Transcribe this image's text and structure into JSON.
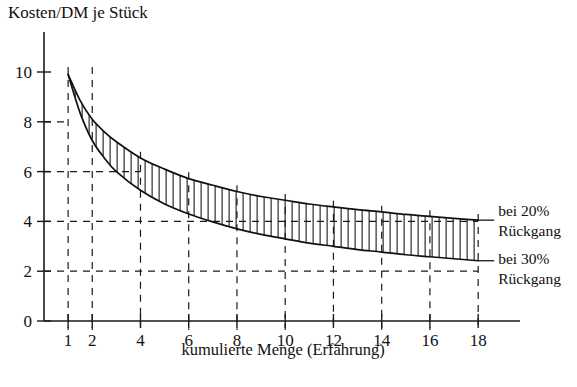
{
  "chart_data": {
    "type": "line",
    "title": "Kosten/DM je Stück",
    "xlabel": "kumulierte Menge (Erfahrung)",
    "ylabel": "Kosten/DM je Stück",
    "xlim": [
      0,
      19
    ],
    "ylim": [
      0,
      11.2
    ],
    "grid": "dashed-partial",
    "legend_position": "right-inline",
    "x_ticks": [
      1,
      2,
      4,
      6,
      8,
      10,
      12,
      14,
      16,
      18
    ],
    "x_tick_labels": [
      "1",
      "2",
      "4",
      "6",
      "8",
      "10",
      "12",
      "14",
      "16",
      "18"
    ],
    "y_ticks": [
      0,
      2,
      4,
      6,
      8,
      10
    ],
    "y_tick_labels": [
      "0",
      "2",
      "4",
      "6",
      "8",
      "10"
    ],
    "series": [
      {
        "name": "bei 20% Rückgang",
        "annotation": "bei 20%\nRückgang",
        "annotation_line1": "bei 20%",
        "annotation_line2": "Rückgang",
        "x": [
          1,
          1.5,
          2,
          2.5,
          3,
          4,
          5,
          6,
          7,
          8,
          9,
          10,
          11,
          12,
          13,
          14,
          15,
          16,
          17,
          18
        ],
        "y": [
          9.9,
          8.85,
          8.1,
          7.6,
          7.2,
          6.55,
          6.1,
          5.72,
          5.45,
          5.2,
          5.0,
          4.85,
          4.7,
          4.58,
          4.47,
          4.38,
          4.28,
          4.2,
          4.12,
          4.05
        ]
      },
      {
        "name": "bei 30% Rückgang",
        "annotation": "bei 30%\nRückgang",
        "annotation_line1": "bei 30%",
        "annotation_line2": "Rückgang",
        "x": [
          1,
          1.5,
          2,
          2.5,
          3,
          4,
          5,
          6,
          7,
          8,
          9,
          10,
          11,
          12,
          13,
          14,
          15,
          16,
          17,
          18
        ],
        "y": [
          9.9,
          8.35,
          7.25,
          6.55,
          6.0,
          5.25,
          4.7,
          4.3,
          3.98,
          3.7,
          3.48,
          3.3,
          3.13,
          3.0,
          2.87,
          2.77,
          2.66,
          2.58,
          2.5,
          2.42
        ]
      }
    ],
    "band_fill": "hatched-vertical",
    "gridlines_h": [
      {
        "value": 8,
        "extends_to_x": 1
      },
      {
        "value": 6,
        "extends_to_x": 4
      },
      {
        "value": 4,
        "extends_to_x": 18
      },
      {
        "value": 2,
        "extends_to_x": 18
      }
    ],
    "gridlines_v": [
      1,
      2,
      4,
      6,
      8,
      10,
      12,
      14,
      16,
      18
    ]
  },
  "colors": {
    "ink": "#111111",
    "background": "#ffffff"
  }
}
